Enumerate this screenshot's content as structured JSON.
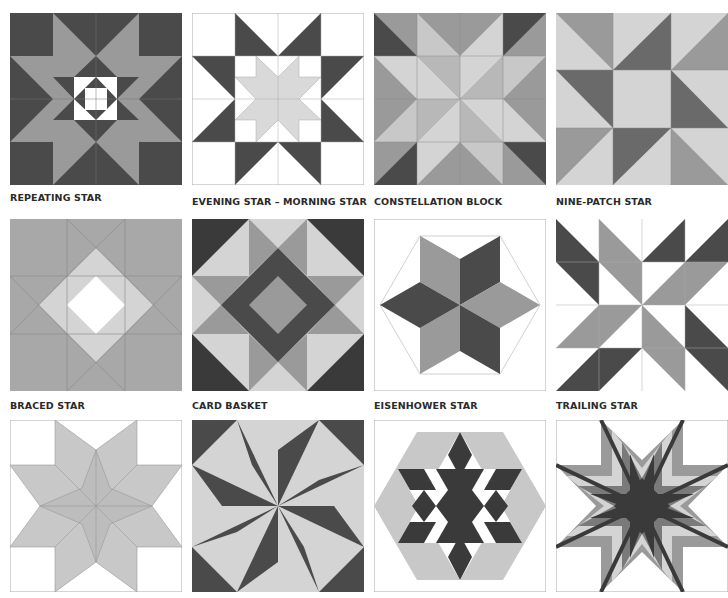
{
  "colors": {
    "dark": "#4a4a4a",
    "mid": "#9a9a9a",
    "light": "#d4d4d4",
    "white": "#ffffff",
    "line": "#8a8a8a"
  },
  "blocks": [
    {
      "label": "REPEATING STAR"
    },
    {
      "label": "EVENING STAR – MORNING STAR"
    },
    {
      "label": "CONSTELLATION BLOCK"
    },
    {
      "label": "NINE-PATCH STAR"
    },
    {
      "label": "BRACED STAR"
    },
    {
      "label": "CARD BASKET"
    },
    {
      "label": "EISENHOWER STAR"
    },
    {
      "label": "TRAILING STAR"
    },
    {
      "label": ""
    },
    {
      "label": ""
    },
    {
      "label": ""
    },
    {
      "label": ""
    }
  ]
}
